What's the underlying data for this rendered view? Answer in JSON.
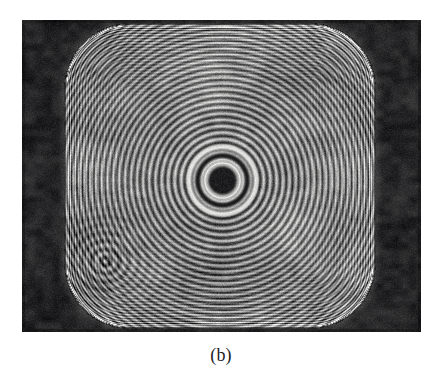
{
  "figure": {
    "caption": "(b)",
    "kind": "photograph",
    "description_semantics": {
      "pattern": "concentric circular interference fringes (Newton-ring / zone-plate style) inside a rounded-square aperture",
      "center_feature": "dark circular core surrounded by bright ring and dense concentric rings",
      "secondary_feature": "small off-axis ring cluster in lower-left quadrant",
      "edges": "dense high-frequency fringes crowding toward the rounded-square boundary",
      "side_bands": "opaque dark vertical bands at left and right of the plate"
    },
    "plate": {
      "x": 22,
      "y": 20,
      "width": 399,
      "height": 312,
      "background_hex": "#0a0a0a"
    },
    "colors": {
      "paper_hex": "#ffffff",
      "plate_dark_hex": "#0a0a0a",
      "field_mid_gray_hex": "#808080",
      "fringe_bright_hex": "#f0f0f0",
      "fringe_dark_hex": "#101010",
      "caption_hex": "#1d1d1d"
    },
    "geometry": {
      "field_left": 65,
      "field_right": 375,
      "field_top": 24,
      "field_bottom": 328,
      "corner_radius": 64,
      "bullseye_center_x": 222,
      "bullseye_center_y": 180,
      "bullseye_core_radius": 12,
      "fringe_period_px": 7.2,
      "secondary_ring_center_x": 105,
      "secondary_ring_center_y": 261,
      "secondary_ring_radius": 26
    }
  }
}
